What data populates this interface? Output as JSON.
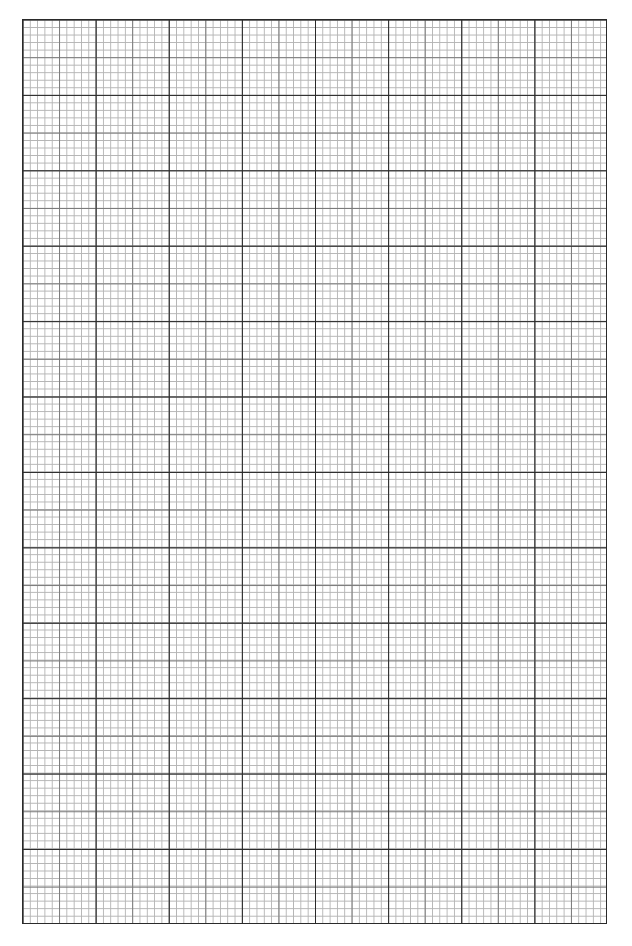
{
  "page": {
    "type": "graph-paper",
    "major_columns": 8,
    "major_rows": 12,
    "minor_subdivisions_per_major": 10,
    "colors": {
      "major_line": "#2a2a2a",
      "medium_line": "#7a7a7a",
      "minor_line": "#b4b4b4",
      "background": "#ffffff"
    }
  }
}
